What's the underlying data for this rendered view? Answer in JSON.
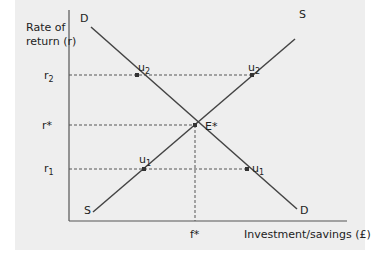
{
  "diagram": {
    "type": "supply-demand",
    "y_axis_label_line1": "Rate of",
    "y_axis_label_line2": "return (r)",
    "x_axis_label": "Investment/savings (£)",
    "y_ticks": [
      {
        "id": "r2",
        "base": "r",
        "sub": "2"
      },
      {
        "id": "rstar",
        "base": "r*",
        "sub": ""
      },
      {
        "id": "r1",
        "base": "r",
        "sub": "1"
      }
    ],
    "x_ticks": [
      {
        "id": "fstar",
        "label": "f*"
      }
    ],
    "curves": [
      {
        "id": "demand",
        "label_start": "D",
        "label_end": "D"
      },
      {
        "id": "supply",
        "label_start": "S",
        "label_end": "S"
      }
    ],
    "points": [
      {
        "id": "u2-demand",
        "base": "u",
        "sub": "2"
      },
      {
        "id": "u2-supply",
        "base": "u",
        "sub": "2"
      },
      {
        "id": "equilibrium",
        "base": "E*",
        "sub": ""
      },
      {
        "id": "u1-supply",
        "base": "u",
        "sub": "1"
      },
      {
        "id": "u1-demand",
        "base": "u",
        "sub": "1"
      }
    ],
    "colors": {
      "background": "#eeeeee",
      "line": "#444444",
      "dash": "#555555"
    }
  }
}
